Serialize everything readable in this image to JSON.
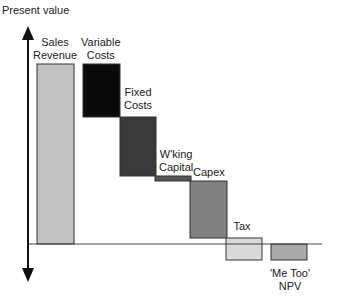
{
  "chart_data": {
    "type": "waterfall",
    "title": "",
    "ylabel": "Present value",
    "xlabel": "",
    "grid": false,
    "legend": "none",
    "baseline_y_px": 244,
    "categories": [
      "Sales Revenue",
      "Variable Costs",
      "Fixed Costs",
      "W'king Capital",
      "Capex",
      "Tax",
      "'Me Too' NPV"
    ],
    "bars": [
      {
        "label_lines": [
          "Sales",
          "Revenue"
        ],
        "x": 37,
        "w": 37,
        "top": 64,
        "bottom": 244,
        "color": "#c2c2c2",
        "label_x": 55,
        "label_y": 36
      },
      {
        "label_lines": [
          "Variable",
          "Costs"
        ],
        "x": 83,
        "w": 37,
        "top": 64,
        "bottom": 117,
        "color": "#0a0a0a",
        "label_x": 101,
        "label_y": 36
      },
      {
        "label_lines": [
          "Fixed",
          "Costs"
        ],
        "x": 120,
        "w": 36,
        "top": 117,
        "bottom": 176,
        "color": "#3a3a3a",
        "label_x": 138,
        "label_y": 86
      },
      {
        "label_lines": [
          "W'king",
          "Capital"
        ],
        "x": 155,
        "w": 36,
        "top": 176,
        "bottom": 181,
        "color": "#555555",
        "label_x": 176,
        "label_y": 148
      },
      {
        "label_lines": [
          "Capex"
        ],
        "x": 190,
        "w": 37,
        "top": 181,
        "bottom": 238,
        "color": "#808080",
        "label_x": 209,
        "label_y": 166
      },
      {
        "label_lines": [
          "Tax"
        ],
        "x": 226,
        "w": 36,
        "top": 238,
        "bottom": 260,
        "color": "#dadada",
        "label_x": 242,
        "label_y": 220
      },
      {
        "label_lines": [
          "'Me Too'",
          "NPV"
        ],
        "x": 271,
        "w": 36,
        "top": 244,
        "bottom": 260,
        "color": "#a9a9a9",
        "label_x": 290,
        "label_y": 267
      }
    ],
    "values_relative": [
      180,
      -53,
      -59,
      -5,
      -57,
      -22,
      -16
    ],
    "note": "Values are relative pixel magnitudes; no numeric axis ticks are shown."
  }
}
